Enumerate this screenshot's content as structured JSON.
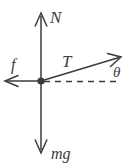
{
  "diagram": {
    "type": "free-body-diagram",
    "canvas": {
      "width": 135,
      "height": 167,
      "background": "#ffffff"
    },
    "ink_color": "#3b3b3b",
    "origin": {
      "x": 41,
      "y": 81,
      "label": "particle"
    },
    "vectors": [
      {
        "id": "normal",
        "label": "N",
        "description": "normal force, points straight up",
        "direction": "up",
        "angle_deg": 90,
        "from": {
          "x": 41,
          "y": 81
        },
        "to": {
          "x": 41,
          "y": 13
        },
        "style": "solid",
        "label_pos": {
          "x": 50,
          "y": 23
        }
      },
      {
        "id": "friction",
        "label": "f",
        "description": "friction force, points left",
        "direction": "left",
        "angle_deg": 180,
        "from": {
          "x": 41,
          "y": 81
        },
        "to": {
          "x": 5,
          "y": 81
        },
        "style": "solid",
        "label_pos": {
          "x": 12,
          "y": 70
        }
      },
      {
        "id": "tension",
        "label": "T",
        "description": "tension force, points up and to the right at angle theta above horizontal",
        "direction": "up-right",
        "angle_deg": 13,
        "from": {
          "x": 41,
          "y": 81
        },
        "to": {
          "x": 121,
          "y": 57
        },
        "style": "solid",
        "label_pos": {
          "x": 63,
          "y": 67
        }
      },
      {
        "id": "weight",
        "label": "mg",
        "description": "weight, points straight down",
        "direction": "down",
        "angle_deg": 270,
        "from": {
          "x": 41,
          "y": 81
        },
        "to": {
          "x": 41,
          "y": 153
        },
        "style": "solid",
        "label_pos": {
          "x": 52,
          "y": 159
        }
      }
    ],
    "reference_line": {
      "id": "horizontal-dashed",
      "description": "dashed horizontal reference line to the right of origin",
      "from": {
        "x": 41,
        "y": 81
      },
      "to": {
        "x": 118,
        "y": 81
      },
      "style": "dashed"
    },
    "angle_annotation": {
      "id": "theta",
      "label": "θ",
      "description": "angle between tension vector and horizontal dashed line",
      "label_pos": {
        "x": 113,
        "y": 76
      }
    }
  }
}
